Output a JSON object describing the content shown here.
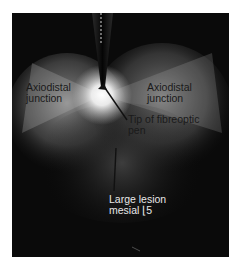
{
  "figure": {
    "type": "clinical photograph",
    "colors": {
      "background": "#ffffff",
      "photo_base": "#0a0a0a",
      "glow": "#ffffff",
      "label_dark": "#1a1a1a",
      "label_light": "#e8e8e8"
    }
  },
  "labels": {
    "axiodistal_left": {
      "line1": "Axiodistal",
      "line2": "junction"
    },
    "axiodistal_right": {
      "line1": "Axiodistal",
      "line2": "junction"
    },
    "pen_tip": {
      "line1": "Tip of fibreoptic",
      "line2": "pen"
    },
    "lesion": {
      "line1": "Large lesion",
      "line2": "mesial ⌊5"
    }
  }
}
